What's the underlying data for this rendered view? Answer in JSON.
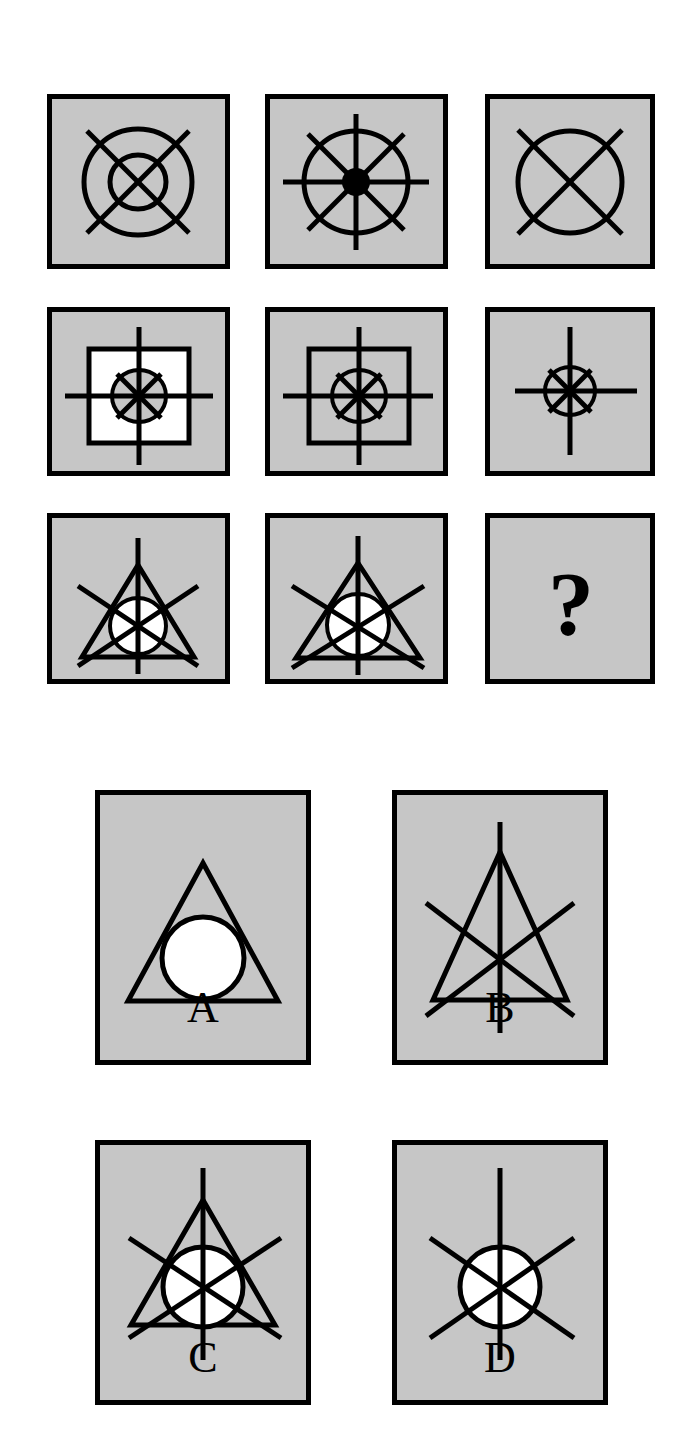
{
  "puzzle": {
    "type": "matrix-reasoning-item",
    "title": "",
    "missing_cell_symbol": "?",
    "colors": {
      "panel_fill": "#c6c6c6",
      "panel_border": "#000000",
      "stroke": "#000000",
      "white_fill": "#ffffff",
      "page_background": "#ffffff"
    },
    "matrix": {
      "rows": 3,
      "columns": 3,
      "cells": [
        {
          "id": "cell-1-1",
          "row": 1,
          "column": 1,
          "description": "Gray square containing two concentric circles and a diagonal X crossing both",
          "elements": [
            "outer-circle",
            "inner-circle",
            "diagonal-cross"
          ]
        },
        {
          "id": "cell-1-2",
          "row": 1,
          "column": 2,
          "description": "Gray square containing a circle, eight radiating spokes and a solid black dot at the centre",
          "elements": [
            "circle",
            "eight-spokes",
            "black-center-dot"
          ]
        },
        {
          "id": "cell-1-3",
          "row": 1,
          "column": 3,
          "description": "Gray square containing a single circle crossed by a diagonal X",
          "elements": [
            "circle",
            "diagonal-cross"
          ]
        },
        {
          "id": "cell-2-1",
          "row": 2,
          "column": 1,
          "description": "Gray square containing a white square, a gray-filled circle and a cross plus short diagonals",
          "elements": [
            "white-square",
            "gray-circle",
            "vertical-horizontal-cross",
            "short-diagonals"
          ]
        },
        {
          "id": "cell-2-2",
          "row": 2,
          "column": 2,
          "description": "Gray square containing an outlined square, an outlined circle and a cross plus short diagonals",
          "elements": [
            "outlined-square",
            "circle",
            "vertical-horizontal-cross",
            "short-diagonals"
          ]
        },
        {
          "id": "cell-2-3",
          "row": 2,
          "column": 3,
          "description": "Gray square containing a small circle and a cross plus short diagonals",
          "elements": [
            "circle",
            "vertical-horizontal-cross",
            "short-diagonals"
          ]
        },
        {
          "id": "cell-3-1",
          "row": 3,
          "column": 1,
          "description": "Gray square containing a triangle, a white circle and six radiating spokes",
          "elements": [
            "triangle",
            "white-circle",
            "six-spokes"
          ]
        },
        {
          "id": "cell-3-2",
          "row": 3,
          "column": 2,
          "description": "Gray square containing a larger triangle, a white circle and six radiating spokes",
          "elements": [
            "triangle",
            "white-circle",
            "six-spokes"
          ]
        },
        {
          "id": "cell-3-3",
          "row": 3,
          "column": 3,
          "description": "Gray square containing a question mark — the missing answer",
          "elements": [
            "question-mark"
          ],
          "text": "?"
        }
      ]
    },
    "options": [
      {
        "id": "option-a",
        "label": "A",
        "description": "Gray square with a triangle and a white circle, no spokes",
        "elements": [
          "triangle",
          "white-circle"
        ]
      },
      {
        "id": "option-b",
        "label": "B",
        "description": "Gray square with a triangle and six radiating spokes, no circle",
        "elements": [
          "triangle",
          "six-spokes"
        ]
      },
      {
        "id": "option-c",
        "label": "C",
        "description": "Gray square with a triangle, a white circle and six radiating spokes",
        "elements": [
          "triangle",
          "white-circle",
          "six-spokes"
        ]
      },
      {
        "id": "option-d",
        "label": "D",
        "description": "Gray square with a white circle and six radiating spokes, no triangle",
        "elements": [
          "white-circle",
          "six-spokes"
        ]
      }
    ]
  }
}
